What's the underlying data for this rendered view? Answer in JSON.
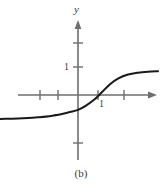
{
  "figure": {
    "caption": "(b)",
    "background_color": "#ffffff",
    "axis_color": "#6e6e6e",
    "curve_color": "#1a1a1a",
    "label_color": "#3a3a3a"
  },
  "chart_data": {
    "type": "line",
    "title": "",
    "subtitle": "",
    "xlabel": "",
    "ylabel": "y",
    "grid": false,
    "legend": null,
    "annotations": [
      "(b)"
    ],
    "axes": {
      "x_axis": {
        "name": "",
        "arrow": "right",
        "origin_px": 78,
        "unit_px": 20,
        "tick_values": [
          -2,
          -1,
          1,
          2
        ],
        "tick_labels": [
          "",
          "",
          "1",
          ""
        ],
        "labeled_ticks": [
          {
            "value": 1,
            "label": "1"
          }
        ],
        "range": [
          -4,
          4.2
        ]
      },
      "y_axis": {
        "name": "y",
        "arrow": "up",
        "origin_px": 95,
        "unit_px": 24,
        "tick_values": [
          -1,
          1,
          2
        ],
        "tick_labels": [
          "",
          "1",
          ""
        ],
        "labeled_ticks": [
          {
            "value": 1,
            "label": "1"
          }
        ],
        "range": [
          -2.6,
          2.8
        ]
      }
    },
    "series": [
      {
        "name": "sigmoid-curve",
        "description": "increasing S-shaped odd-symmetric curve with horizontal asymptotes",
        "color": "#1a1a1a",
        "linewidth": 2,
        "asymptotes": {
          "left_y": -1.0,
          "right_y": 1.0
        },
        "x_intercept": 0.95,
        "y_intercept": -0.62,
        "x": [
          -3.9,
          -3.5,
          -3.0,
          -2.5,
          -2.0,
          -1.6,
          -1.2,
          -0.8,
          -0.4,
          0.0,
          0.4,
          0.8,
          1.2,
          1.6,
          2.0,
          2.5,
          3.0,
          3.5,
          4.0
        ],
        "y": [
          -1.0,
          -0.99,
          -0.98,
          -0.96,
          -0.93,
          -0.9,
          -0.85,
          -0.79,
          -0.71,
          -0.62,
          -0.44,
          -0.2,
          0.12,
          0.45,
          0.68,
          0.85,
          0.93,
          0.97,
          0.99
        ]
      }
    ]
  }
}
